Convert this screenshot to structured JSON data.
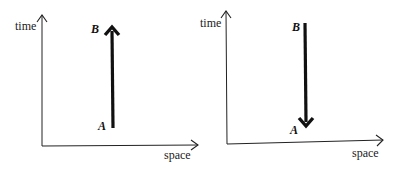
{
  "diagrams": [
    {
      "id": "left",
      "y_axis_label": "time",
      "x_axis_label": "space",
      "arrow_direction": "up",
      "start_label": "A",
      "end_label": "B"
    },
    {
      "id": "right",
      "y_axis_label": "time",
      "x_axis_label": "space",
      "arrow_direction": "down",
      "start_label": "B",
      "end_label": "A"
    }
  ],
  "colors": {
    "ink": "#111111",
    "background": "#ffffff"
  }
}
